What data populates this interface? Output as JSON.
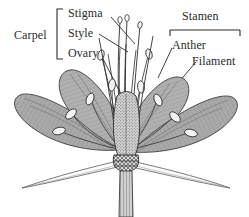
{
  "figure": {
    "background_color": "#ffffff",
    "ink_color": "#2b2b2b",
    "petal_fill_color": "#a8a8a8",
    "sepal_fill_color": "#fbfbfb",
    "anther_fill_color": "#f2f2f2"
  },
  "labels": {
    "carpel": "Carpel",
    "stigma": "Stigma",
    "style": "Style",
    "ovary": "Ovary",
    "stamen": "Stamen",
    "anther": "Anther",
    "filament": "Filament"
  },
  "groups": [
    {
      "name": "carpel",
      "heading": "Carpel",
      "bracket": "left-square-bracket",
      "members": [
        "Stigma",
        "Style",
        "Ovary"
      ]
    },
    {
      "name": "stamen",
      "heading": "Stamen",
      "bracket": "top-horizontal-bracket",
      "members": [
        "Anther",
        "Filament"
      ]
    }
  ]
}
